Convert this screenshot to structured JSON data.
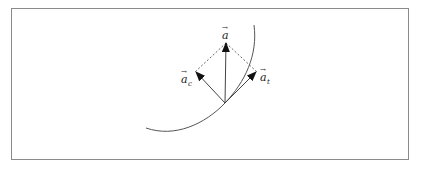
{
  "diagram": {
    "labels": {
      "total": "a",
      "centripetal": "a",
      "centripetal_sub": "c",
      "tangential": "a",
      "tangential_sub": "t",
      "vector_mark": "→"
    },
    "colors": {
      "border": "#8a8a8a",
      "lines": "#444444",
      "dashed": "#555555"
    },
    "points": {
      "origin": [
        225,
        103
      ],
      "a_tip": [
        226,
        43
      ],
      "ac_tip": [
        196,
        72
      ],
      "at_tip": [
        256,
        72
      ]
    }
  }
}
